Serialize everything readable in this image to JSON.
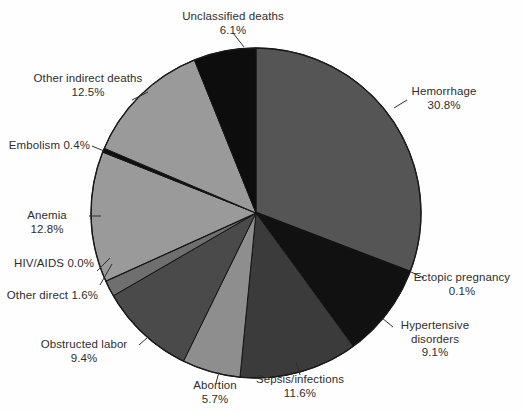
{
  "chart_data": {
    "type": "pie",
    "title": "",
    "subtitle": "",
    "xlabel": "",
    "ylabel": "",
    "legend_position": "none",
    "grid": false,
    "units": "percent",
    "start_angle_deg": 0,
    "direction": "clockwise",
    "categories": [
      "Hemorrhage",
      "Ectopic pregnancy",
      "Hypertensive disorders",
      "Sepsis/infections",
      "Abortion",
      "Obstructed labor",
      "Other direct",
      "HIV/AIDS",
      "Anemia",
      "Embolism",
      "Other indirect deaths",
      "Unclassified deaths"
    ],
    "values": [
      30.8,
      0.1,
      9.1,
      11.6,
      5.7,
      9.4,
      1.6,
      0.0,
      12.8,
      0.4,
      12.5,
      6.1
    ],
    "colors": [
      "#555555",
      "#111111",
      "#111111",
      "#3b3b3b",
      "#8e8e8e",
      "#4a4a4a",
      "#6f6f6f",
      "#141414",
      "#9a9a9a",
      "#101010",
      "#9a9a9a",
      "#0d0d0d"
    ],
    "slices": [
      {
        "label": "Hemorrhage",
        "value": 30.8,
        "value_text": "30.8%",
        "color": "#555555"
      },
      {
        "label": "Ectopic pregnancy",
        "value": 0.1,
        "value_text": "0.1%",
        "color": "#111111"
      },
      {
        "label": "Hypertensive disorders",
        "value": 9.1,
        "value_text": "9.1%",
        "color": "#111111"
      },
      {
        "label": "Sepsis/infections",
        "value": 11.6,
        "value_text": "11.6%",
        "color": "#3b3b3b"
      },
      {
        "label": "Abortion",
        "value": 5.7,
        "value_text": "5.7%",
        "color": "#8e8e8e"
      },
      {
        "label": "Obstructed labor",
        "value": 9.4,
        "value_text": "9.4%",
        "color": "#4a4a4a"
      },
      {
        "label": "Other direct",
        "value": 1.6,
        "value_text": "1.6%",
        "color": "#6f6f6f"
      },
      {
        "label": "HIV/AIDS",
        "value": 0.0,
        "value_text": "0.0%",
        "color": "#141414"
      },
      {
        "label": "Anemia",
        "value": 12.8,
        "value_text": "12.8%",
        "color": "#9a9a9a"
      },
      {
        "label": "Embolism",
        "value": 0.4,
        "value_text": "0.4%",
        "color": "#101010"
      },
      {
        "label": "Other indirect deaths",
        "value": 12.5,
        "value_text": "12.5%",
        "color": "#9a9a9a"
      },
      {
        "label": "Unclassified deaths",
        "value": 6.1,
        "value_text": "6.1%",
        "color": "#0d0d0d"
      }
    ]
  },
  "labels": {
    "unclassified": {
      "name": "Unclassified deaths",
      "pct": "6.1%"
    },
    "other_indirect": {
      "name": "Other indirect deaths",
      "pct": "12.5%"
    },
    "embolism": {
      "name": "Embolism",
      "pct": "0.4%"
    },
    "anemia": {
      "name": "Anemia",
      "pct": "12.8%"
    },
    "hiv_aids": {
      "name": "HIV/AIDS",
      "pct": "0.0%"
    },
    "other_direct": {
      "name": "Other direct",
      "pct": "1.6%"
    },
    "obstructed": {
      "name": "Obstructed labor",
      "pct": "9.4%"
    },
    "abortion": {
      "name": "Abortion",
      "pct": "5.7%"
    },
    "sepsis": {
      "name": "Sepsis/infections",
      "pct": "11.6%"
    },
    "hypertensive": {
      "name": "Hypertensive",
      "pct": "9.1%",
      "name2": "disorders"
    },
    "ectopic": {
      "name": "Ectopic pregnancy",
      "pct": "0.1%"
    },
    "hemorrhage": {
      "name": "Hemorrhage",
      "pct": "30.8%"
    }
  }
}
